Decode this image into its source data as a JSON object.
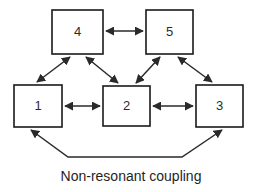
{
  "diagram": {
    "caption": "Non-resonant coupling",
    "stroke_color": "#2a2a2a",
    "box_fill": "#ffffff",
    "background": "#ffffff",
    "nodes": [
      {
        "id": "node-4",
        "label": "4",
        "x": 52,
        "y": 10,
        "w": 51,
        "h": 44
      },
      {
        "id": "node-5",
        "label": "5",
        "x": 146,
        "y": 10,
        "w": 47,
        "h": 44
      },
      {
        "id": "node-1",
        "label": "1",
        "x": 14,
        "y": 85,
        "w": 48,
        "h": 42
      },
      {
        "id": "node-2",
        "label": "2",
        "x": 103,
        "y": 86,
        "w": 47,
        "h": 40
      },
      {
        "id": "node-3",
        "label": "3",
        "x": 196,
        "y": 85,
        "w": 47,
        "h": 42
      }
    ],
    "links": [
      {
        "id": "link-4-5",
        "from": "4",
        "to": "5",
        "kind": "horizontal",
        "arrows": "both"
      },
      {
        "id": "link-1-2",
        "from": "1",
        "to": "2",
        "kind": "horizontal",
        "arrows": "both"
      },
      {
        "id": "link-2-3",
        "from": "2",
        "to": "3",
        "kind": "horizontal",
        "arrows": "both"
      },
      {
        "id": "link-4-1",
        "from": "4",
        "to": "1",
        "kind": "diagonal",
        "arrows": "both"
      },
      {
        "id": "link-4-2",
        "from": "4",
        "to": "2",
        "kind": "diagonal",
        "arrows": "both"
      },
      {
        "id": "link-5-2",
        "from": "5",
        "to": "2",
        "kind": "diagonal",
        "arrows": "both"
      },
      {
        "id": "link-5-3",
        "from": "5",
        "to": "3",
        "kind": "diagonal",
        "arrows": "both"
      },
      {
        "id": "link-1-3-nonresonant",
        "from": "1",
        "to": "3",
        "kind": "bottom-bus",
        "arrows": "both"
      }
    ]
  }
}
